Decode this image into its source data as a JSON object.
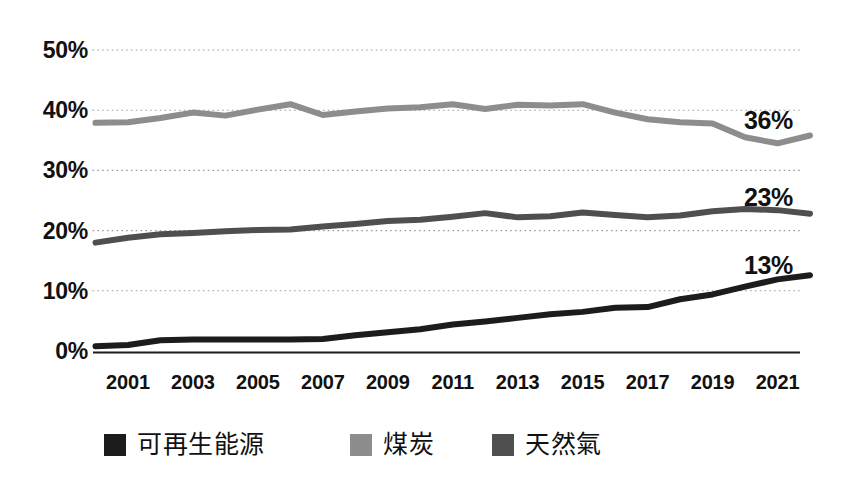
{
  "chart_data": {
    "type": "line",
    "title": "",
    "subtitle": "",
    "xlabel": "",
    "ylabel": "",
    "xlim": [
      2000,
      2022
    ],
    "ylim": [
      0,
      50
    ],
    "y_unit": "%",
    "grid": true,
    "grid_style": "dotted-horizontal",
    "legend_position": "bottom",
    "x": [
      2000,
      2001,
      2002,
      2003,
      2004,
      2005,
      2006,
      2007,
      2008,
      2009,
      2010,
      2011,
      2012,
      2013,
      2014,
      2015,
      2016,
      2017,
      2018,
      2019,
      2020,
      2021,
      2022
    ],
    "y_ticks": [
      0,
      10,
      20,
      30,
      40,
      50
    ],
    "y_tick_labels": [
      "0%",
      "10%",
      "20%",
      "30%",
      "40%",
      "50%"
    ],
    "x_ticks": [
      2001,
      2003,
      2005,
      2007,
      2009,
      2011,
      2013,
      2015,
      2017,
      2019,
      2021
    ],
    "x_tick_labels": [
      "2001",
      "2003",
      "2005",
      "2007",
      "2009",
      "2011",
      "2013",
      "2015",
      "2017",
      "2019",
      "2021"
    ],
    "series": [
      {
        "name": "可再生能源",
        "color": "#1c1c1c",
        "end_label": "13%",
        "end_value": 13,
        "values": [
          0.8,
          1.0,
          1.8,
          1.9,
          1.9,
          1.9,
          1.9,
          2.0,
          2.6,
          3.1,
          3.6,
          4.4,
          4.9,
          5.5,
          6.1,
          6.5,
          7.2,
          7.3,
          8.6,
          9.4,
          10.7,
          11.9,
          12.6
        ]
      },
      {
        "name": "煤炭",
        "color": "#8d8d8d",
        "end_label": "36%",
        "end_value": 36,
        "values": [
          37.9,
          38.0,
          38.7,
          39.6,
          39.1,
          40.1,
          41.0,
          39.2,
          39.8,
          40.3,
          40.5,
          41.0,
          40.2,
          40.9,
          40.8,
          41.0,
          39.6,
          38.5,
          38.0,
          37.8,
          35.5,
          34.5,
          35.8
        ]
      },
      {
        "name": "天然氣",
        "color": "#4f4f4f",
        "end_label": "23%",
        "end_value": 23,
        "values": [
          18.0,
          18.8,
          19.4,
          19.6,
          19.9,
          20.1,
          20.2,
          20.7,
          21.1,
          21.6,
          21.8,
          22.3,
          22.9,
          22.2,
          22.4,
          23.0,
          22.6,
          22.2,
          22.5,
          23.2,
          23.6,
          23.4,
          22.8
        ]
      }
    ]
  },
  "axes": {
    "y_labels": [
      {
        "text": "50%",
        "value": 50
      },
      {
        "text": "40%",
        "value": 40
      },
      {
        "text": "30%",
        "value": 30
      },
      {
        "text": "20%",
        "value": 20
      },
      {
        "text": "10%",
        "value": 10
      },
      {
        "text": "0%",
        "value": 0
      }
    ],
    "x_labels": [
      "2001",
      "2003",
      "2005",
      "2007",
      "2009",
      "2011",
      "2013",
      "2015",
      "2017",
      "2019",
      "2021"
    ]
  },
  "annotations": {
    "coal_end": "36%",
    "gas_end": "23%",
    "renewables_end": "13%"
  },
  "legend": {
    "items": [
      {
        "label": "可再生能源",
        "color": "#1c1c1c"
      },
      {
        "label": "煤炭",
        "color": "#8d8d8d"
      },
      {
        "label": "天然氣",
        "color": "#4f4f4f"
      }
    ]
  },
  "colors": {
    "background": "#ffffff",
    "text": "#111111",
    "grid": "#9a9a9a",
    "axis": "#1c1c1c",
    "renewables": "#1c1c1c",
    "coal": "#8d8d8d",
    "gas": "#4f4f4f"
  }
}
